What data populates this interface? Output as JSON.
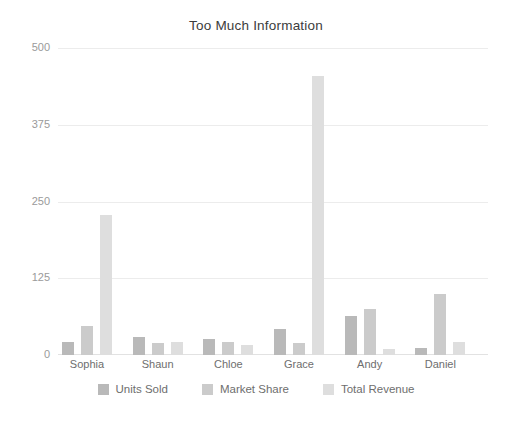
{
  "chart_data": {
    "type": "bar",
    "title": "Too Much Information",
    "xlabel": "",
    "ylabel": "",
    "ylim": [
      0,
      500
    ],
    "yticks": [
      0,
      125,
      250,
      375,
      500
    ],
    "grid": true,
    "legend_position": "bottom",
    "categories": [
      "Sophia",
      "Shaun",
      "Chloe",
      "Grace",
      "Andy",
      "Daniel"
    ],
    "series": [
      {
        "name": "Units Sold",
        "color": "#b9b9b9",
        "values": [
          22,
          30,
          26,
          43,
          63,
          12
        ]
      },
      {
        "name": "Market Share",
        "color": "#cbcbcb",
        "values": [
          48,
          20,
          22,
          20,
          75,
          100
        ]
      },
      {
        "name": "Total Revenue",
        "color": "#dedede",
        "values": [
          228,
          22,
          17,
          455,
          10,
          22
        ]
      }
    ],
    "bar_values_flat": [
      22,
      48,
      228,
      30,
      20,
      22,
      26,
      22,
      17,
      43,
      20,
      455,
      63,
      75,
      10,
      12,
      100,
      22
    ]
  }
}
